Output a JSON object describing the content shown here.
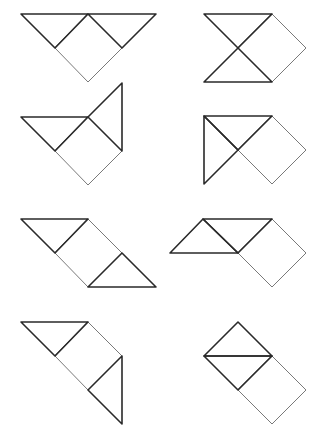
{
  "diagram": {
    "colors": {
      "triangle_stroke": "#2a2a2a",
      "square_stroke": "#6a6a6a",
      "background": "#ffffff"
    },
    "figures": [
      {
        "id": "figure-1",
        "triangles": [
          [
            [
              21,
              14
            ],
            [
              88,
              14
            ],
            [
              55,
              48
            ]
          ],
          [
            [
              88,
              14
            ],
            [
              156,
              14
            ],
            [
              122,
              48
            ]
          ]
        ],
        "square": [
          [
            88,
            14
          ],
          [
            122,
            48
          ],
          [
            88,
            82
          ],
          [
            55,
            48
          ]
        ]
      },
      {
        "id": "figure-2",
        "triangles": [
          [
            [
              204,
              14
            ],
            [
              272,
              14
            ],
            [
              238,
              48
            ]
          ],
          [
            [
              204,
              82
            ],
            [
              272,
              82
            ],
            [
              238,
              48
            ]
          ]
        ],
        "square": [
          [
            272,
            14
          ],
          [
            306,
            48
          ],
          [
            272,
            82
          ],
          [
            238,
            48
          ]
        ]
      },
      {
        "id": "figure-3",
        "triangles": [
          [
            [
              21,
              117
            ],
            [
              88,
              117
            ],
            [
              55,
              151
            ]
          ],
          [
            [
              122,
              83
            ],
            [
              122,
              151
            ],
            [
              88,
              117
            ]
          ]
        ],
        "square": [
          [
            88,
            117
          ],
          [
            122,
            151
          ],
          [
            88,
            185
          ],
          [
            55,
            151
          ]
        ]
      },
      {
        "id": "figure-4",
        "triangles": [
          [
            [
              204,
              116
            ],
            [
              272,
              116
            ],
            [
              238,
              150
            ]
          ],
          [
            [
              204,
              116
            ],
            [
              204,
              184
            ],
            [
              238,
              150
            ]
          ]
        ],
        "square": [
          [
            272,
            116
          ],
          [
            306,
            150
          ],
          [
            272,
            184
          ],
          [
            238,
            150
          ]
        ]
      },
      {
        "id": "figure-5",
        "triangles": [
          [
            [
              21,
              219
            ],
            [
              88,
              219
            ],
            [
              55,
              253
            ]
          ],
          [
            [
              88,
              287
            ],
            [
              156,
              287
            ],
            [
              122,
              253
            ]
          ]
        ],
        "square": [
          [
            88,
            219
          ],
          [
            122,
            253
          ],
          [
            88,
            287
          ],
          [
            55,
            253
          ]
        ]
      },
      {
        "id": "figure-6",
        "triangles": [
          [
            [
              170,
              253
            ],
            [
              238,
              253
            ],
            [
              203,
              219
            ]
          ],
          [
            [
              203,
              219
            ],
            [
              272,
              219
            ],
            [
              238,
              253
            ]
          ]
        ],
        "square": [
          [
            272,
            219
          ],
          [
            306,
            253
          ],
          [
            272,
            287
          ],
          [
            238,
            253
          ]
        ]
      },
      {
        "id": "figure-7",
        "triangles": [
          [
            [
              21,
              322
            ],
            [
              88,
              322
            ],
            [
              55,
              356
            ]
          ],
          [
            [
              122,
              356
            ],
            [
              122,
              424
            ],
            [
              88,
              390
            ]
          ]
        ],
        "square": [
          [
            88,
            322
          ],
          [
            122,
            356
          ],
          [
            88,
            390
          ],
          [
            55,
            356
          ]
        ]
      },
      {
        "id": "figure-8",
        "triangles": [
          [
            [
              238,
              322
            ],
            [
              272,
              356
            ],
            [
              204,
              356
            ]
          ],
          [
            [
              204,
              356
            ],
            [
              272,
              356
            ],
            [
              238,
              390
            ]
          ]
        ],
        "square": [
          [
            272,
            356
          ],
          [
            306,
            390
          ],
          [
            272,
            424
          ],
          [
            238,
            390
          ]
        ]
      }
    ]
  }
}
